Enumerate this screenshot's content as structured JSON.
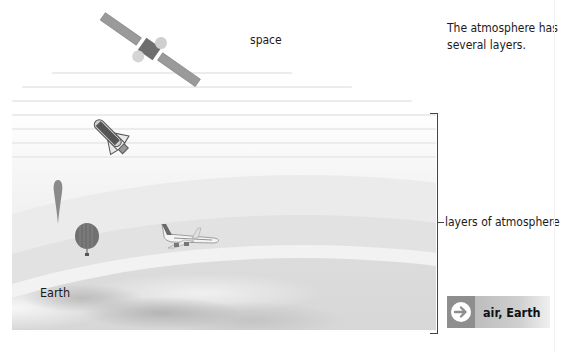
{
  "diagram": {
    "intro_text": "The atmosphere has several layers.",
    "labels": {
      "space": "space",
      "earth": "Earth",
      "layers": "layers of atmosphere"
    },
    "objects": [
      {
        "name": "satellite",
        "region": "space"
      },
      {
        "name": "space-shuttle",
        "region": "upper atmosphere"
      },
      {
        "name": "weather-balloon",
        "region": "atmosphere"
      },
      {
        "name": "hot-air-balloon",
        "region": "lower atmosphere"
      },
      {
        "name": "airplane",
        "region": "lower atmosphere"
      }
    ]
  },
  "link_button": {
    "icon": "arrow-right-circle-icon",
    "label": "air, Earth"
  },
  "colors": {
    "bracket": "#444444",
    "button_dark": "#8e8e8e",
    "button_light": "#f0f0f0",
    "text": "#1a1a1a"
  }
}
